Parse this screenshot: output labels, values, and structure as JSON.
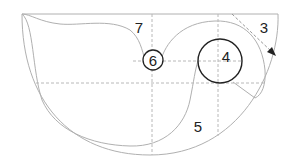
{
  "diagram": {
    "type": "anatomical-region-diagram",
    "colors": {
      "outline": "#b0b0b0",
      "dashed": "#b8b8b8",
      "circle": "#222222",
      "label": "#222222",
      "arrow": "#333333"
    },
    "labels": [
      {
        "id": "region-7",
        "text": "7"
      },
      {
        "id": "region-3",
        "text": "3"
      },
      {
        "id": "region-4",
        "text": "4"
      },
      {
        "id": "region-6",
        "text": "6"
      },
      {
        "id": "region-5",
        "text": "5"
      }
    ]
  }
}
